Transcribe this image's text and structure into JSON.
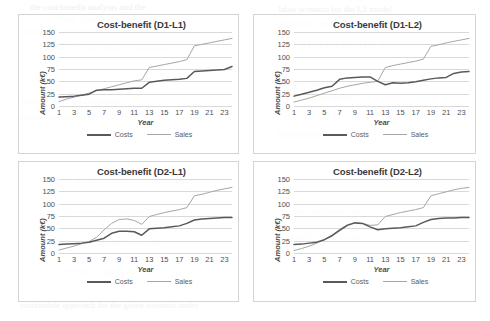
{
  "background_artifacts": [
    {
      "text": "the cost-benefit analysis and the",
      "x": 30,
      "y": 2,
      "size": 9,
      "opacity": 0.5
    },
    {
      "text": "case. Cost structure is to be",
      "x": 60,
      "y": 14,
      "size": 9,
      "opacity": 0.45
    },
    {
      "text": "strategy is included, which gives",
      "x": 24,
      "y": 26,
      "size": 9,
      "opacity": 0.4
    },
    {
      "text": "the SUSTAINability planning",
      "x": 40,
      "y": 40,
      "size": 11,
      "opacity": 0.35
    },
    {
      "text": "demand over the cost of the",
      "x": 22,
      "y": 96,
      "size": 9,
      "opacity": 0.4
    },
    {
      "text": "through the legend sites for the",
      "x": 18,
      "y": 112,
      "size": 9,
      "opacity": 0.4
    },
    {
      "text": "labor scenario for the L2 model",
      "x": 278,
      "y": 4,
      "size": 9,
      "opacity": 0.42
    },
    {
      "text": "economic and stable for the",
      "x": 282,
      "y": 18,
      "size": 9,
      "opacity": 0.42
    },
    {
      "text": "SUSTAINABLE",
      "x": 300,
      "y": 36,
      "size": 13,
      "opacity": 0.32
    },
    {
      "text": "business plan and the",
      "x": 276,
      "y": 78,
      "size": 9,
      "opacity": 0.4
    },
    {
      "text": "future of the market",
      "x": 284,
      "y": 92,
      "size": 9,
      "opacity": 0.4
    },
    {
      "text": "Different",
      "x": 276,
      "y": 128,
      "size": 12,
      "opacity": 0.34
    },
    {
      "text": "business model for sustainability",
      "x": 76,
      "y": 176,
      "size": 9,
      "opacity": 0.4
    },
    {
      "text": "the model applied in the second",
      "x": 66,
      "y": 206,
      "size": 9,
      "opacity": 0.38
    },
    {
      "text": "cost and the second",
      "x": 90,
      "y": 238,
      "size": 9,
      "opacity": 0.38
    },
    {
      "text": "revenue is higher for this",
      "x": 62,
      "y": 266,
      "size": 9,
      "opacity": 0.38
    },
    {
      "text": "Revenue",
      "x": 404,
      "y": 172,
      "size": 12,
      "opacity": 0.3
    },
    {
      "text": "the conclusion that",
      "x": 292,
      "y": 206,
      "size": 9,
      "opacity": 0.36
    },
    {
      "text": "model is valid in the",
      "x": 286,
      "y": 232,
      "size": 9,
      "opacity": 0.36
    },
    {
      "text": "are able to",
      "x": 300,
      "y": 258,
      "size": 9,
      "opacity": 0.36
    },
    {
      "text": "sustainable approach for the given scenario under",
      "x": 20,
      "y": 300,
      "size": 9,
      "opacity": 0.38
    }
  ],
  "colors": {
    "costs": "#595959",
    "sales": "#a6a6a6",
    "gridline": "#d9d9d9",
    "border": "#d4d4d4",
    "text": "#4f4f4f"
  },
  "chart_data": [
    {
      "type": "line",
      "panel": "top-left",
      "title": "Cost-benefit (D1-L1)",
      "xlabel": "Year",
      "ylabel": "Amount (k€)",
      "ylim": [
        0,
        150
      ],
      "yticks": [
        0,
        25,
        50,
        75,
        100,
        125,
        150
      ],
      "xlim": [
        1,
        24
      ],
      "xticks": [
        1,
        3,
        5,
        7,
        9,
        11,
        13,
        15,
        17,
        19,
        21,
        23
      ],
      "grid": true,
      "legend_position": "bottom",
      "x": [
        1,
        2,
        3,
        4,
        5,
        6,
        7,
        8,
        9,
        10,
        11,
        12,
        13,
        14,
        15,
        16,
        17,
        18,
        19,
        20,
        21,
        22,
        23,
        24
      ],
      "series": [
        {
          "name": "Costs",
          "color": "#595959",
          "values": [
            18,
            19,
            20,
            22,
            24,
            32,
            33,
            33,
            34,
            35,
            36,
            36,
            48,
            50,
            52,
            53,
            54,
            56,
            70,
            71,
            72,
            73,
            74,
            80
          ]
        },
        {
          "name": "Sales",
          "color": "#a6a6a6",
          "values": [
            9,
            14,
            18,
            22,
            26,
            31,
            35,
            39,
            43,
            47,
            51,
            53,
            78,
            81,
            84,
            87,
            90,
            94,
            122,
            125,
            128,
            131,
            134,
            137
          ]
        }
      ]
    },
    {
      "type": "line",
      "panel": "top-right",
      "title": "Cost-benefit (D1-L2)",
      "xlabel": "Year",
      "ylabel": "Amount (k€)",
      "ylim": [
        0,
        150
      ],
      "yticks": [
        0,
        25,
        50,
        75,
        100,
        125,
        150
      ],
      "xlim": [
        1,
        24
      ],
      "xticks": [
        1,
        3,
        5,
        7,
        9,
        11,
        13,
        15,
        17,
        19,
        21,
        23
      ],
      "grid": true,
      "legend_position": "bottom",
      "x": [
        1,
        2,
        3,
        4,
        5,
        6,
        7,
        8,
        9,
        10,
        11,
        12,
        13,
        14,
        15,
        16,
        17,
        18,
        19,
        20,
        21,
        22,
        23,
        24
      ],
      "series": [
        {
          "name": "Costs",
          "color": "#595959",
          "values": [
            20,
            24,
            28,
            32,
            37,
            40,
            54,
            57,
            58,
            59,
            59,
            50,
            43,
            47,
            46,
            47,
            49,
            52,
            55,
            57,
            58,
            66,
            69,
            70
          ]
        },
        {
          "name": "Sales",
          "color": "#a6a6a6",
          "values": [
            8,
            12,
            16,
            21,
            26,
            31,
            36,
            40,
            43,
            46,
            48,
            50,
            78,
            82,
            85,
            88,
            91,
            95,
            121,
            124,
            128,
            131,
            134,
            137
          ]
        }
      ]
    },
    {
      "type": "line",
      "panel": "bottom-left",
      "title": "Cost-benefit (D2-L1)",
      "xlabel": "Year",
      "ylabel": "Amount (k€)",
      "ylim": [
        0,
        150
      ],
      "yticks": [
        0,
        25,
        50,
        75,
        100,
        125,
        150
      ],
      "xlim": [
        1,
        24
      ],
      "xticks": [
        1,
        3,
        5,
        7,
        9,
        11,
        13,
        15,
        17,
        19,
        21,
        23
      ],
      "grid": true,
      "legend_position": "bottom",
      "x": [
        1,
        2,
        3,
        4,
        5,
        6,
        7,
        8,
        9,
        10,
        11,
        12,
        13,
        14,
        15,
        16,
        17,
        18,
        19,
        20,
        21,
        22,
        23,
        24
      ],
      "series": [
        {
          "name": "Costs",
          "color": "#595959",
          "values": [
            17,
            18,
            19,
            20,
            22,
            26,
            30,
            40,
            44,
            44,
            43,
            36,
            49,
            50,
            51,
            53,
            55,
            60,
            67,
            69,
            70,
            71,
            72,
            72
          ]
        },
        {
          "name": "Sales",
          "color": "#a6a6a6",
          "values": [
            6,
            10,
            14,
            19,
            23,
            32,
            47,
            60,
            68,
            69,
            66,
            58,
            74,
            78,
            82,
            85,
            88,
            92,
            116,
            119,
            123,
            127,
            130,
            133
          ]
        }
      ]
    },
    {
      "type": "line",
      "panel": "bottom-right",
      "title": "Cost-benefit (D2-L2)",
      "xlabel": "Year",
      "ylabel": "Amount (k€)",
      "ylim": [
        0,
        150
      ],
      "yticks": [
        0,
        25,
        50,
        75,
        100,
        125,
        150
      ],
      "xlim": [
        1,
        24
      ],
      "xticks": [
        1,
        3,
        5,
        7,
        9,
        11,
        13,
        15,
        17,
        19,
        21,
        23
      ],
      "grid": true,
      "legend_position": "bottom",
      "x": [
        1,
        2,
        3,
        4,
        5,
        6,
        7,
        8,
        9,
        10,
        11,
        12,
        13,
        14,
        15,
        16,
        17,
        18,
        19,
        20,
        21,
        22,
        23,
        24
      ],
      "series": [
        {
          "name": "Costs",
          "color": "#595959",
          "values": [
            17,
            18,
            20,
            22,
            27,
            35,
            46,
            56,
            61,
            60,
            53,
            47,
            49,
            50,
            51,
            53,
            55,
            62,
            68,
            70,
            71,
            71,
            72,
            72
          ]
        },
        {
          "name": "Sales",
          "color": "#a6a6a6",
          "values": [
            5,
            9,
            14,
            20,
            27,
            36,
            48,
            57,
            62,
            60,
            56,
            57,
            74,
            78,
            82,
            85,
            88,
            92,
            116,
            120,
            124,
            128,
            131,
            133
          ]
        }
      ]
    }
  ]
}
